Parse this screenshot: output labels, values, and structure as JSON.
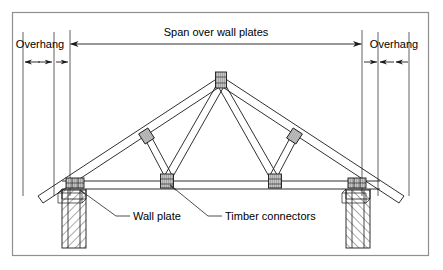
{
  "figure": {
    "background_color": "#ffffff",
    "border_color": "#8f8f8f",
    "line_color": "#1a1a1a",
    "text_color": "#000000",
    "connector_fill": "#b8b8b8"
  },
  "dimensions": {
    "span": {
      "label": "Span over wall plates",
      "arrow_style": "double-headed"
    },
    "overhang_left": {
      "label": "Overhang",
      "arrow_style": "double-headed"
    },
    "overhang_right": {
      "label": "Overhang",
      "arrow_style": "double-headed"
    }
  },
  "callouts": [
    {
      "label": "Wall plate",
      "leader": "diagonal-leader-line",
      "points_to": "left-wall-plate-connector"
    },
    {
      "label": "Timber connectors",
      "leader": "diagonal-leader-line",
      "points_to": "bottom-chord-connector-left"
    }
  ],
  "truss_parts": {
    "apex_connector": "apex-timber-connector",
    "rafter_connectors": 2,
    "bottom_chord_connectors": 2,
    "wall_plate_connectors": 2,
    "walls": 2
  }
}
